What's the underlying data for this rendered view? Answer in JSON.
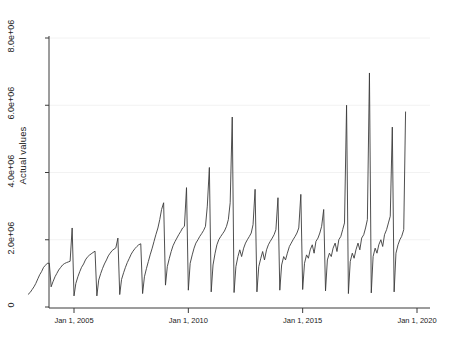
{
  "chart_data": {
    "type": "line",
    "title": "",
    "subtitle": "",
    "xlabel": "",
    "ylabel": "Actual values",
    "grid": true,
    "grid_color": "#f2f2f2",
    "legend": "none",
    "line_color": "#3b3b3b",
    "background": "#ffffff",
    "xlim_dates": [
      "Jan 1, 2003",
      "Jan 1, 2020"
    ],
    "ylim": [
      0,
      8800000
    ],
    "y_ticks": [
      0,
      2000000,
      4000000,
      6000000,
      8000000
    ],
    "y_tick_labels": [
      "0",
      "2.0e+06",
      "4.0e+06",
      "6.0e+06",
      "8.0e+06"
    ],
    "x_ticks": [
      "Jan 1, 2005",
      "Jan 1, 2010",
      "Jan 1, 2015",
      "Jan 1, 2020"
    ],
    "x_tick_values": [
      2005.0,
      2010.0,
      2015.0,
      2020.0
    ],
    "series": [
      {
        "name": "Actual values",
        "x": [
          2003.0,
          2003.08,
          2003.17,
          2003.25,
          2003.33,
          2003.42,
          2003.5,
          2003.58,
          2003.67,
          2003.75,
          2003.83,
          2003.92,
          2004.0,
          2004.08,
          2004.17,
          2004.25,
          2004.33,
          2004.42,
          2004.5,
          2004.58,
          2004.67,
          2004.75,
          2004.83,
          2004.92,
          2005.0,
          2005.08,
          2005.17,
          2005.25,
          2005.33,
          2005.42,
          2005.5,
          2005.58,
          2005.67,
          2005.75,
          2005.83,
          2005.92,
          2006.0,
          2006.08,
          2006.17,
          2006.25,
          2006.33,
          2006.42,
          2006.5,
          2006.58,
          2006.67,
          2006.75,
          2006.83,
          2006.92,
          2007.0,
          2007.08,
          2007.17,
          2007.25,
          2007.33,
          2007.42,
          2007.5,
          2007.58,
          2007.67,
          2007.75,
          2007.83,
          2007.92,
          2008.0,
          2008.08,
          2008.17,
          2008.25,
          2008.33,
          2008.42,
          2008.5,
          2008.58,
          2008.67,
          2008.75,
          2008.83,
          2008.92,
          2009.0,
          2009.08,
          2009.17,
          2009.25,
          2009.33,
          2009.42,
          2009.5,
          2009.58,
          2009.67,
          2009.75,
          2009.83,
          2009.92,
          2010.0,
          2010.08,
          2010.17,
          2010.25,
          2010.33,
          2010.42,
          2010.5,
          2010.58,
          2010.67,
          2010.75,
          2010.83,
          2010.92,
          2011.0,
          2011.08,
          2011.17,
          2011.25,
          2011.33,
          2011.42,
          2011.5,
          2011.58,
          2011.67,
          2011.75,
          2011.83,
          2011.92,
          2012.0,
          2012.08,
          2012.17,
          2012.25,
          2012.33,
          2012.42,
          2012.5,
          2012.58,
          2012.67,
          2012.75,
          2012.83,
          2012.92,
          2013.0,
          2013.08,
          2013.17,
          2013.25,
          2013.33,
          2013.42,
          2013.5,
          2013.58,
          2013.67,
          2013.75,
          2013.83,
          2013.92,
          2014.0,
          2014.08,
          2014.17,
          2014.25,
          2014.33,
          2014.42,
          2014.5,
          2014.58,
          2014.67,
          2014.75,
          2014.83,
          2014.92,
          2015.0,
          2015.08,
          2015.17,
          2015.25,
          2015.33,
          2015.42,
          2015.5,
          2015.58,
          2015.67,
          2015.75,
          2015.83,
          2015.92,
          2016.0,
          2016.08,
          2016.17,
          2016.25,
          2016.33,
          2016.42,
          2016.5,
          2016.58,
          2016.67,
          2016.75,
          2016.83,
          2016.92,
          2017.0,
          2017.08,
          2017.17,
          2017.25,
          2017.33,
          2017.42,
          2017.5,
          2017.58,
          2017.67,
          2017.75,
          2017.83,
          2017.92,
          2018.0,
          2018.08,
          2018.17,
          2018.25,
          2018.33,
          2018.42,
          2018.5,
          2018.58,
          2018.67,
          2018.75,
          2018.83,
          2018.92,
          2019.0,
          2019.08,
          2019.17,
          2019.25,
          2019.33,
          2019.42,
          2019.5
        ],
        "values": [
          380000,
          430000,
          520000,
          600000,
          700000,
          840000,
          960000,
          1050000,
          1180000,
          1240000,
          1300000,
          1300000,
          600000,
          750000,
          900000,
          1000000,
          1100000,
          1180000,
          1250000,
          1290000,
          1320000,
          1340000,
          1360000,
          2350000,
          330000,
          700000,
          900000,
          1050000,
          1180000,
          1280000,
          1400000,
          1480000,
          1540000,
          1580000,
          1620000,
          1660000,
          330000,
          800000,
          1000000,
          1150000,
          1280000,
          1400000,
          1520000,
          1600000,
          1680000,
          1720000,
          1760000,
          2050000,
          370000,
          820000,
          1020000,
          1180000,
          1320000,
          1450000,
          1570000,
          1660000,
          1740000,
          1800000,
          1850000,
          1880000,
          400000,
          900000,
          1150000,
          1350000,
          1550000,
          1750000,
          1950000,
          2150000,
          2350000,
          2600000,
          2900000,
          3100000,
          650000,
          1200000,
          1450000,
          1650000,
          1820000,
          1950000,
          2050000,
          2150000,
          2250000,
          2350000,
          2400000,
          3550000,
          500000,
          1300000,
          1550000,
          1750000,
          1900000,
          2000000,
          2100000,
          2180000,
          2280000,
          2400000,
          3000000,
          4150000,
          450000,
          1250000,
          1600000,
          1850000,
          2000000,
          2100000,
          2180000,
          2260000,
          2400000,
          2600000,
          3100000,
          5650000,
          430000,
          1200000,
          1500000,
          1700000,
          1500000,
          1750000,
          1900000,
          2000000,
          2100000,
          2200000,
          2450000,
          3500000,
          450000,
          1200000,
          1450000,
          1650000,
          1400000,
          1700000,
          1850000,
          1950000,
          2050000,
          2150000,
          2300000,
          3250000,
          500000,
          1250000,
          1500000,
          1400000,
          1600000,
          1800000,
          1900000,
          2000000,
          2100000,
          2200000,
          2350000,
          3350000,
          520000,
          1300000,
          1550000,
          1450000,
          1700000,
          1850000,
          1600000,
          1950000,
          2050000,
          2200000,
          2400000,
          2900000,
          480000,
          1400000,
          1600000,
          1500000,
          1750000,
          1900000,
          1650000,
          2000000,
          2100000,
          2300000,
          2500000,
          6000000,
          400000,
          1350000,
          1600000,
          1450000,
          1700000,
          1900000,
          1700000,
          2050000,
          2150000,
          2350000,
          2600000,
          6960000,
          420000,
          1500000,
          1750000,
          1600000,
          1850000,
          2000000,
          1800000,
          2150000,
          2300000,
          2500000,
          2700000,
          5350000,
          450000,
          1600000,
          1850000,
          2000000,
          2100000,
          2300000,
          5800000
        ]
      }
    ]
  },
  "axes": {
    "y_title": "Actual values"
  }
}
